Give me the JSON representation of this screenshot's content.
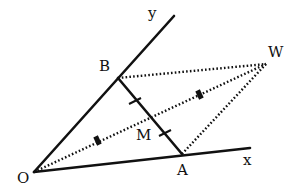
{
  "diagram": {
    "type": "geometry-parallelogram",
    "points": {
      "O": {
        "label": "O",
        "x": 34,
        "y": 172,
        "label_x": 17,
        "label_y": 183
      },
      "A": {
        "label": "A",
        "x": 182,
        "y": 154,
        "label_x": 177,
        "label_y": 175
      },
      "B": {
        "label": "B",
        "x": 118,
        "y": 78,
        "label_x": 99,
        "label_y": 71
      },
      "W": {
        "label": "W",
        "x": 266,
        "y": 64,
        "label_x": 268,
        "label_y": 57
      },
      "M": {
        "label": "M",
        "x": 150,
        "y": 116,
        "label_x": 136,
        "label_y": 140
      }
    },
    "axes": {
      "x": {
        "label": "x",
        "end_x": 250,
        "end_y": 148,
        "label_x": 243,
        "label_y": 165
      },
      "y": {
        "label": "y",
        "end_x": 174,
        "end_y": 16,
        "label_x": 148,
        "label_y": 18
      }
    },
    "segments": {
      "solid": [
        "O-x",
        "O-y",
        "B-A"
      ],
      "dotted": [
        "B-W",
        "A-W",
        "O-W"
      ]
    },
    "equal_marks": {
      "single_tick": [
        "BM",
        "MA"
      ],
      "block_mark": [
        "OM",
        "MW"
      ]
    },
    "colors": {
      "ink": "#111111",
      "background": "#ffffff"
    }
  }
}
